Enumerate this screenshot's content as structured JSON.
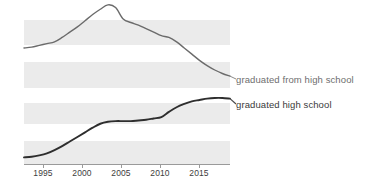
{
  "figure": {
    "name": "google-ngram-viewer-chart",
    "background": "#ffffff",
    "band_color": "#ebebeb",
    "axis_color": "#9a9a9a"
  },
  "chart_data": {
    "type": "line",
    "title": "",
    "subtitle": "",
    "xlabel": "",
    "ylabel": "",
    "grid": "horizontal-alternating-bands",
    "legend_position": "right-inline-at-line-end",
    "xlim": [
      1992,
      2019
    ],
    "xticks": [
      1995,
      2000,
      2005,
      2010,
      2015
    ],
    "xticklabels": [
      "1995",
      "2000",
      "2005",
      "2010",
      "2015"
    ],
    "yticklabels": [],
    "panels": [
      {
        "name": "upper-panel",
        "series_index": 0,
        "ylim_px": [
          4,
          92
        ]
      },
      {
        "name": "lower-panel",
        "series_index": 1,
        "ylim_px": [
          98,
          164
        ]
      }
    ],
    "series": [
      {
        "name": "graduated from high school",
        "color": "#6b6b6b",
        "linewidth": 1.4,
        "x": [
          1992,
          1993,
          1994,
          1995,
          1996,
          1997,
          1998,
          1999,
          2000,
          2001,
          2002,
          2003,
          2004,
          2005,
          2006,
          2007,
          2008,
          2009,
          2010,
          2011,
          2012,
          2013,
          2014,
          2015,
          2016,
          2017,
          2018,
          2019
        ],
        "values": [
          0.5,
          0.51,
          0.53,
          0.55,
          0.57,
          0.62,
          0.68,
          0.74,
          0.81,
          0.88,
          0.94,
          0.99,
          0.96,
          0.83,
          0.79,
          0.76,
          0.72,
          0.68,
          0.64,
          0.62,
          0.57,
          0.5,
          0.43,
          0.36,
          0.3,
          0.25,
          0.21,
          0.18
        ]
      },
      {
        "name": "graduated high school",
        "color": "#2e2e2e",
        "linewidth": 1.9,
        "x": [
          1992,
          1993,
          1994,
          1995,
          1996,
          1997,
          1998,
          1999,
          2000,
          2001,
          2002,
          2003,
          2004,
          2005,
          2006,
          2007,
          2008,
          2009,
          2010,
          2011,
          2012,
          2013,
          2014,
          2015,
          2016,
          2017,
          2018,
          2019
        ],
        "values": [
          0.1,
          0.11,
          0.13,
          0.16,
          0.21,
          0.27,
          0.34,
          0.41,
          0.48,
          0.55,
          0.61,
          0.64,
          0.65,
          0.65,
          0.65,
          0.66,
          0.67,
          0.69,
          0.71,
          0.79,
          0.86,
          0.91,
          0.95,
          0.97,
          0.99,
          1.0,
          1.0,
          0.99
        ]
      }
    ],
    "legend": [
      {
        "label": "graduated from high school",
        "color": "#6e6e6e"
      },
      {
        "label": "graduated high school",
        "color": "#3a3a3a"
      }
    ]
  },
  "axis": {
    "ticks": [
      {
        "label": "1995",
        "x_px": 43
      },
      {
        "label": "2000",
        "x_px": 82
      },
      {
        "label": "2005",
        "x_px": 121
      },
      {
        "label": "2010",
        "x_px": 160
      },
      {
        "label": "2015",
        "x_px": 199
      }
    ]
  }
}
